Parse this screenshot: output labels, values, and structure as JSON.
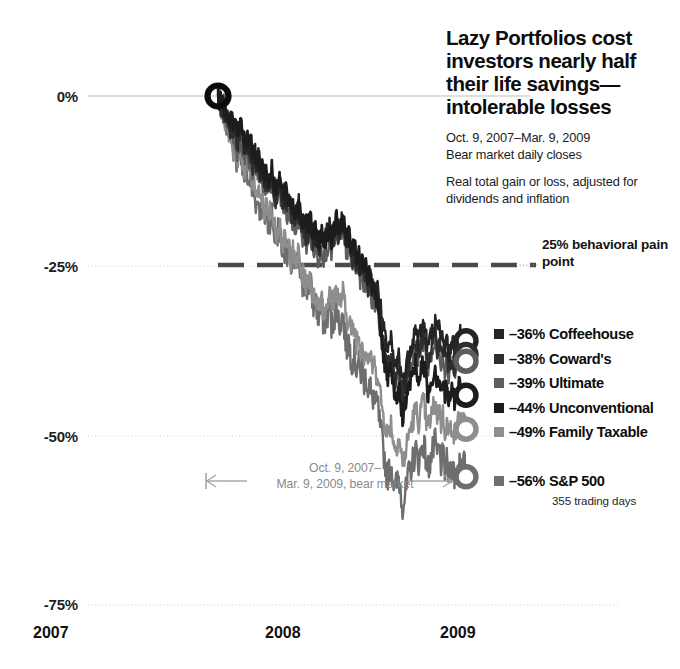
{
  "title": "Lazy Portfolios cost investors nearly half their life savings—intolerable losses",
  "subtitle_1": "Oct. 9, 2007–Mar. 9, 2009\nBear market daily closes",
  "subtitle_2": "Real total gain or loss, adjusted for dividends and inflation",
  "annotations": {
    "pain_point": "25% behavioral pain point",
    "bear_market": "Oct. 9, 2007–\nMar. 9, 2009, bear market",
    "trading_days": "355 trading days"
  },
  "axes": {
    "y_ticks": [
      "0%",
      "-25%",
      "-50%",
      "-75%"
    ],
    "x_ticks": [
      "2007",
      "2008",
      "2009"
    ]
  },
  "legend": {
    "items": [
      {
        "value": "–36%",
        "name": "Coffeehouse",
        "color": "#242424"
      },
      {
        "value": "–38%",
        "name": "Coward's",
        "color": "#2e2e2e"
      },
      {
        "value": "–39%",
        "name": "Ultimate",
        "color": "#5d5d5d"
      },
      {
        "value": "–44%",
        "name": "Unconventional",
        "color": "#1c1c1c"
      },
      {
        "value": "–49%",
        "name": "Family Taxable",
        "color": "#8e8e8e"
      },
      {
        "value": "–56%",
        "name": "S&P 500",
        "color": "#6e6e6e"
      }
    ]
  },
  "chart_data": {
    "type": "line",
    "title": "Lazy Portfolios cost investors nearly half their life savings—intolerable losses",
    "subtitle": "Oct. 9, 2007–Mar. 9, 2009 Bear market daily closes. Real total gain or loss, adjusted for dividends and inflation",
    "xlabel": "",
    "ylabel": "Real total gain or loss",
    "xlim": [
      "2007-10-09",
      "2009-03-09"
    ],
    "ylim": [
      -75,
      0
    ],
    "x_ticks": [
      "2007",
      "2008",
      "2009"
    ],
    "y_ticks": [
      0,
      -25,
      -50,
      -75
    ],
    "grid": true,
    "legend_position": "right",
    "reference_line": {
      "value": -25,
      "label": "25% behavioral pain point",
      "style": "dashed"
    },
    "start_marker": {
      "x": "2007-10-09",
      "y": 0
    },
    "trading_days": 355,
    "series": [
      {
        "name": "Coffeehouse",
        "color": "#242424",
        "final_value": -36,
        "values": [
          0,
          -1,
          -2,
          -1,
          -3,
          -2,
          -4,
          -3,
          -5,
          -4,
          -6,
          -5,
          -4,
          -6,
          -7,
          -6,
          -8,
          -7,
          -9,
          -8,
          -10,
          -9,
          -11,
          -10,
          -12,
          -11,
          -13,
          -12,
          -11,
          -13,
          -14,
          -13,
          -12,
          -14,
          -15,
          -14,
          -16,
          -15,
          -17,
          -16,
          -18,
          -17,
          -16,
          -18,
          -19,
          -18,
          -20,
          -19,
          -18,
          -20,
          -21,
          -20,
          -22,
          -21,
          -20,
          -22,
          -21,
          -20,
          -19,
          -21,
          -20,
          -19,
          -18,
          -20,
          -19,
          -18,
          -20,
          -21,
          -20,
          -22,
          -23,
          -22,
          -24,
          -23,
          -25,
          -24,
          -26,
          -25,
          -27,
          -26,
          -28,
          -27,
          -29,
          -28,
          -30,
          -32,
          -34,
          -36,
          -38,
          -37,
          -36,
          -38,
          -40,
          -39,
          -38,
          -40,
          -42,
          -41,
          -40,
          -38,
          -37,
          -36,
          -35,
          -34,
          -36,
          -35,
          -34,
          -33,
          -35,
          -37,
          -36,
          -35,
          -34,
          -33,
          -35,
          -34,
          -36,
          -35,
          -37,
          -36,
          -38,
          -37,
          -36,
          -38,
          -37,
          -36,
          -35,
          -36,
          -35,
          -36
        ]
      },
      {
        "name": "Coward's",
        "color": "#2e2e2e",
        "final_value": -38,
        "values": [
          0,
          -1,
          -2,
          -2,
          -3,
          -3,
          -5,
          -4,
          -6,
          -5,
          -7,
          -6,
          -5,
          -7,
          -8,
          -7,
          -9,
          -8,
          -10,
          -9,
          -11,
          -10,
          -12,
          -11,
          -13,
          -12,
          -14,
          -13,
          -12,
          -14,
          -15,
          -14,
          -13,
          -15,
          -16,
          -15,
          -17,
          -16,
          -18,
          -17,
          -19,
          -18,
          -17,
          -19,
          -20,
          -19,
          -21,
          -20,
          -19,
          -21,
          -22,
          -21,
          -23,
          -22,
          -21,
          -23,
          -22,
          -21,
          -20,
          -22,
          -21,
          -20,
          -19,
          -21,
          -20,
          -19,
          -21,
          -22,
          -21,
          -23,
          -24,
          -23,
          -25,
          -24,
          -26,
          -25,
          -27,
          -26,
          -28,
          -27,
          -29,
          -28,
          -30,
          -29,
          -32,
          -34,
          -36,
          -38,
          -40,
          -39,
          -38,
          -40,
          -42,
          -41,
          -40,
          -42,
          -44,
          -43,
          -42,
          -40,
          -39,
          -38,
          -37,
          -36,
          -38,
          -37,
          -36,
          -35,
          -37,
          -39,
          -38,
          -37,
          -36,
          -35,
          -37,
          -36,
          -38,
          -37,
          -39,
          -38,
          -40,
          -39,
          -38,
          -40,
          -39,
          -38,
          -37,
          -38,
          -37,
          -38
        ]
      },
      {
        "name": "Ultimate",
        "color": "#5d5d5d",
        "final_value": -39,
        "values": [
          0,
          -1,
          -2,
          -1,
          -4,
          -3,
          -5,
          -4,
          -7,
          -6,
          -8,
          -7,
          -6,
          -8,
          -9,
          -8,
          -10,
          -9,
          -11,
          -10,
          -12,
          -11,
          -13,
          -12,
          -14,
          -13,
          -15,
          -14,
          -13,
          -15,
          -16,
          -15,
          -14,
          -16,
          -17,
          -16,
          -18,
          -17,
          -19,
          -18,
          -20,
          -19,
          -18,
          -20,
          -21,
          -20,
          -22,
          -21,
          -20,
          -22,
          -23,
          -22,
          -24,
          -23,
          -22,
          -24,
          -23,
          -22,
          -21,
          -23,
          -22,
          -21,
          -20,
          -22,
          -21,
          -20,
          -22,
          -23,
          -22,
          -24,
          -25,
          -24,
          -26,
          -25,
          -27,
          -26,
          -28,
          -27,
          -29,
          -28,
          -30,
          -29,
          -31,
          -30,
          -33,
          -35,
          -37,
          -39,
          -41,
          -40,
          -39,
          -41,
          -43,
          -42,
          -41,
          -43,
          -45,
          -44,
          -43,
          -41,
          -40,
          -39,
          -38,
          -37,
          -39,
          -38,
          -37,
          -36,
          -38,
          -40,
          -39,
          -38,
          -37,
          -36,
          -38,
          -37,
          -39,
          -38,
          -40,
          -39,
          -41,
          -40,
          -39,
          -41,
          -40,
          -39,
          -38,
          -39,
          -38,
          -39
        ]
      },
      {
        "name": "Unconventional",
        "color": "#1c1c1c",
        "final_value": -44,
        "values": [
          0,
          -1,
          -1,
          -1,
          -2,
          -2,
          -3,
          -3,
          -4,
          -4,
          -5,
          -5,
          -4,
          -6,
          -6,
          -6,
          -7,
          -7,
          -8,
          -8,
          -9,
          -9,
          -10,
          -10,
          -11,
          -11,
          -12,
          -12,
          -11,
          -13,
          -13,
          -13,
          -12,
          -14,
          -14,
          -14,
          -15,
          -15,
          -16,
          -16,
          -17,
          -17,
          -16,
          -18,
          -18,
          -18,
          -19,
          -19,
          -18,
          -20,
          -20,
          -20,
          -21,
          -21,
          -20,
          -22,
          -21,
          -20,
          -19,
          -21,
          -20,
          -19,
          -18,
          -20,
          -19,
          -18,
          -20,
          -21,
          -20,
          -22,
          -23,
          -22,
          -24,
          -23,
          -25,
          -24,
          -26,
          -25,
          -27,
          -26,
          -28,
          -27,
          -30,
          -29,
          -33,
          -36,
          -38,
          -40,
          -42,
          -41,
          -40,
          -43,
          -45,
          -44,
          -43,
          -45,
          -47,
          -46,
          -45,
          -43,
          -42,
          -41,
          -40,
          -39,
          -42,
          -41,
          -40,
          -39,
          -41,
          -44,
          -43,
          -42,
          -41,
          -40,
          -42,
          -41,
          -43,
          -42,
          -44,
          -43,
          -45,
          -44,
          -43,
          -45,
          -44,
          -43,
          -42,
          -44,
          -43,
          -44
        ]
      },
      {
        "name": "Family Taxable",
        "color": "#8e8e8e",
        "final_value": -49,
        "values": [
          0,
          -1,
          -2,
          -2,
          -4,
          -3,
          -6,
          -5,
          -8,
          -7,
          -9,
          -8,
          -7,
          -10,
          -11,
          -10,
          -12,
          -11,
          -13,
          -12,
          -15,
          -14,
          -16,
          -15,
          -17,
          -16,
          -18,
          -17,
          -16,
          -19,
          -20,
          -19,
          -18,
          -21,
          -22,
          -21,
          -23,
          -22,
          -24,
          -23,
          -25,
          -24,
          -23,
          -26,
          -27,
          -26,
          -28,
          -27,
          -26,
          -29,
          -30,
          -29,
          -31,
          -30,
          -29,
          -32,
          -31,
          -30,
          -29,
          -31,
          -30,
          -29,
          -28,
          -31,
          -30,
          -29,
          -31,
          -33,
          -32,
          -34,
          -35,
          -34,
          -36,
          -35,
          -37,
          -36,
          -38,
          -37,
          -39,
          -38,
          -40,
          -39,
          -41,
          -40,
          -43,
          -45,
          -47,
          -48,
          -50,
          -49,
          -48,
          -50,
          -52,
          -51,
          -50,
          -52,
          -54,
          -53,
          -52,
          -50,
          -49,
          -48,
          -47,
          -46,
          -48,
          -47,
          -46,
          -45,
          -47,
          -49,
          -48,
          -47,
          -46,
          -45,
          -47,
          -46,
          -48,
          -47,
          -49,
          -48,
          -50,
          -49,
          -48,
          -50,
          -49,
          -48,
          -47,
          -49,
          -48,
          -49
        ]
      },
      {
        "name": "S&P 500",
        "color": "#6e6e6e",
        "final_value": -56,
        "values": [
          0,
          -1,
          -2,
          -2,
          -4,
          -3,
          -6,
          -5,
          -8,
          -7,
          -10,
          -9,
          -8,
          -11,
          -12,
          -11,
          -13,
          -12,
          -15,
          -14,
          -16,
          -15,
          -17,
          -16,
          -18,
          -17,
          -19,
          -18,
          -17,
          -20,
          -21,
          -20,
          -19,
          -22,
          -23,
          -22,
          -24,
          -23,
          -25,
          -24,
          -26,
          -25,
          -24,
          -27,
          -28,
          -27,
          -29,
          -28,
          -27,
          -30,
          -31,
          -30,
          -33,
          -32,
          -31,
          -34,
          -33,
          -32,
          -31,
          -34,
          -33,
          -32,
          -31,
          -34,
          -33,
          -32,
          -35,
          -37,
          -36,
          -38,
          -39,
          -38,
          -40,
          -39,
          -41,
          -40,
          -42,
          -41,
          -43,
          -42,
          -45,
          -44,
          -46,
          -45,
          -48,
          -50,
          -52,
          -54,
          -56,
          -55,
          -54,
          -56,
          -58,
          -57,
          -56,
          -58,
          -60,
          -59,
          -58,
          -56,
          -55,
          -54,
          -53,
          -52,
          -54,
          -53,
          -52,
          -51,
          -53,
          -55,
          -54,
          -53,
          -52,
          -51,
          -53,
          -52,
          -54,
          -53,
          -55,
          -54,
          -56,
          -55,
          -54,
          -56,
          -55,
          -54,
          -53,
          -55,
          -54,
          -56
        ]
      }
    ]
  }
}
